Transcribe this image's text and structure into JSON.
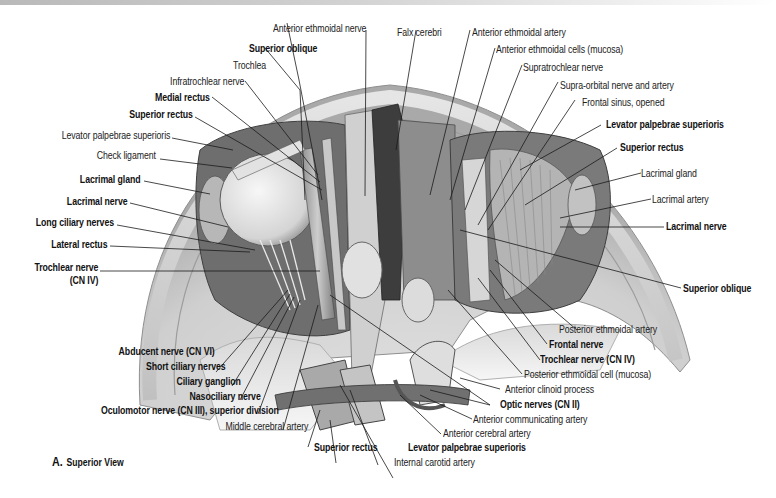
{
  "figure": {
    "caption_letter": "A.",
    "caption_text": "Superior View",
    "colors": {
      "background": "#ffffff",
      "bone_light": "#e6e6e6",
      "bone_mid": "#bdbdbd",
      "shadow": "#4a4a4a",
      "leader_line": "#1a1a1a",
      "label_text": "#222222"
    }
  },
  "labels": {
    "left": [
      {
        "id": "infratrochlear_nerve",
        "text": "Infratrochlear nerve",
        "bold": false
      },
      {
        "id": "medial_rectus",
        "text": "Medial rectus",
        "bold": true
      },
      {
        "id": "superior_rectus_l",
        "text": "Superior rectus",
        "bold": true
      },
      {
        "id": "levator_l",
        "text": "Levator palpebrae superioris",
        "bold": false
      },
      {
        "id": "check_ligament",
        "text": "Check ligament",
        "bold": false
      },
      {
        "id": "lacrimal_gland_l",
        "text": "Lacrimal gland",
        "bold": true
      },
      {
        "id": "lacrimal_nerve_l",
        "text": "Lacrimal nerve",
        "bold": true
      },
      {
        "id": "long_ciliary",
        "text": "Long ciliary nerves",
        "bold": true
      },
      {
        "id": "lateral_rectus",
        "text": "Lateral rectus",
        "bold": true
      },
      {
        "id": "trochlear_l_1",
        "text": "Trochlear nerve",
        "bold": true
      },
      {
        "id": "trochlear_l_2",
        "text": "(CN IV)",
        "bold": true
      }
    ],
    "top": [
      {
        "id": "anterior_ethmoidal_nerve",
        "text": "Anterior ethmoidal nerve",
        "bold": false
      },
      {
        "id": "superior_oblique_top",
        "text": "Superior oblique",
        "bold": true
      },
      {
        "id": "trochlea",
        "text": "Trochlea",
        "bold": false
      },
      {
        "id": "falx_cerebri",
        "text": "Falx cerebri",
        "bold": false
      },
      {
        "id": "anterior_ethmoidal_artery",
        "text": "Anterior ethmoidal artery",
        "bold": false
      },
      {
        "id": "anterior_ethmoidal_cells",
        "text": "Anterior ethmoidal cells (mucosa)",
        "bold": false
      },
      {
        "id": "supratrochlear_nerve",
        "text": "Supratrochlear nerve",
        "bold": false
      },
      {
        "id": "supraorbital",
        "text": "Supra-orbital nerve and artery",
        "bold": false
      },
      {
        "id": "frontal_sinus",
        "text": "Frontal sinus, opened",
        "bold": false
      }
    ],
    "right": [
      {
        "id": "levator_r",
        "text": "Levator palpebrae superioris",
        "bold": true
      },
      {
        "id": "superior_rectus_r",
        "text": "Superior rectus",
        "bold": true
      },
      {
        "id": "lacrimal_gland_r",
        "text": "Lacrimal gland",
        "bold": false
      },
      {
        "id": "lacrimal_artery",
        "text": "Lacrimal artery",
        "bold": false
      },
      {
        "id": "lacrimal_nerve_r",
        "text": "Lacrimal nerve",
        "bold": true
      },
      {
        "id": "superior_oblique_r",
        "text": "Superior oblique",
        "bold": true
      },
      {
        "id": "posterior_ethmoidal_artery",
        "text": "Posterior ethmoidal artery",
        "bold": false
      },
      {
        "id": "frontal_nerve",
        "text": "Frontal nerve",
        "bold": true
      },
      {
        "id": "trochlear_r",
        "text": "Trochlear nerve (CN IV)",
        "bold": true
      },
      {
        "id": "posterior_ethmoidal_cell",
        "text": "Posterior ethmoidal cell (mucosa)",
        "bold": false
      },
      {
        "id": "anterior_clinoid",
        "text": "Anterior clinoid process",
        "bold": false
      },
      {
        "id": "optic_nerves",
        "text": "Optic nerves (CN II)",
        "bold": true
      },
      {
        "id": "anterior_communicating",
        "text": "Anterior communicating artery",
        "bold": false
      },
      {
        "id": "anterior_cerebral",
        "text": "Anterior cerebral artery",
        "bold": false
      }
    ],
    "bottom": [
      {
        "id": "abducent",
        "text": "Abducent nerve (CN VI)",
        "bold": true
      },
      {
        "id": "short_ciliary",
        "text": "Short ciliary nerves",
        "bold": true
      },
      {
        "id": "ciliary_ganglion",
        "text": "Ciliary ganglion",
        "bold": true
      },
      {
        "id": "nasociliary",
        "text": "Nasociliary nerve",
        "bold": true
      },
      {
        "id": "oculomotor",
        "text": "Oculomotor nerve (CN III), superior division",
        "bold": true
      },
      {
        "id": "middle_cerebral",
        "text": "Middle cerebral artery",
        "bold": false
      },
      {
        "id": "superior_rectus_b",
        "text": "Superior rectus",
        "bold": true
      },
      {
        "id": "levator_b",
        "text": "Levator palpebrae superioris",
        "bold": true
      },
      {
        "id": "internal_carotid",
        "text": "Internal carotid artery",
        "bold": false
      }
    ]
  }
}
